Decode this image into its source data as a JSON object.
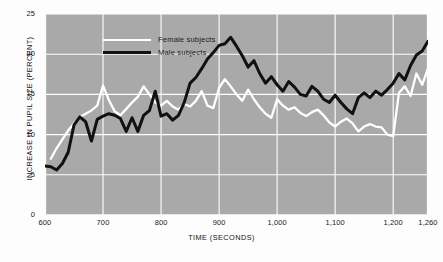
{
  "chart_data": {
    "type": "line",
    "title": "",
    "xlabel": "TIME (SECONDS)",
    "ylabel": "INCREASE IN PUPIL SIZE  (PERCENT)",
    "xlim": [
      600,
      1260
    ],
    "ylim": [
      0,
      25
    ],
    "xticks": [
      600,
      700,
      800,
      900,
      1000,
      1100,
      1200,
      1260
    ],
    "xticklabels": [
      "600",
      "700",
      "800",
      "900",
      "1,000",
      "1,100",
      "1,200",
      "1,260"
    ],
    "yticks": [
      0,
      5,
      10,
      15,
      20,
      25
    ],
    "yticklabels": [
      "0",
      "5",
      "10",
      "15",
      "20",
      "25"
    ],
    "grid": true,
    "grid_color": "#ffffff",
    "plot_background": "#a9a9a9",
    "legend_position": "top-left",
    "annotations": [
      {
        "text": "CONTROL",
        "x": 600,
        "y": 0,
        "color": "#f2f2f2"
      }
    ],
    "series": [
      {
        "name": "Female subjects",
        "color": "#ffffff",
        "x": [
          610,
          620,
          630,
          640,
          650,
          660,
          670,
          680,
          690,
          700,
          710,
          720,
          730,
          740,
          750,
          760,
          770,
          780,
          790,
          800,
          810,
          820,
          830,
          840,
          850,
          860,
          870,
          880,
          890,
          900,
          910,
          920,
          930,
          940,
          950,
          960,
          970,
          980,
          990,
          1000,
          1010,
          1020,
          1030,
          1040,
          1050,
          1060,
          1070,
          1080,
          1090,
          1100,
          1110,
          1120,
          1130,
          1140,
          1150,
          1160,
          1170,
          1180,
          1190,
          1200,
          1210,
          1220,
          1230,
          1240,
          1250,
          1260
        ],
        "y": [
          7.0,
          8.3,
          9.4,
          10.5,
          11.4,
          12.2,
          12.6,
          13.0,
          13.6,
          16.1,
          14.3,
          12.9,
          12.4,
          13.2,
          14.0,
          14.7,
          16.0,
          15.0,
          14.0,
          13.6,
          14.2,
          13.5,
          13.1,
          13.8,
          13.5,
          14.2,
          15.4,
          13.6,
          13.3,
          15.8,
          16.9,
          16.0,
          15.0,
          14.2,
          15.6,
          14.4,
          13.4,
          12.6,
          12.1,
          14.4,
          13.6,
          13.1,
          13.4,
          12.7,
          12.3,
          12.8,
          13.1,
          12.4,
          11.5,
          11.0,
          11.6,
          12.0,
          11.4,
          10.4,
          11.0,
          11.3,
          11.0,
          10.9,
          10.0,
          9.8,
          15.2,
          16.0,
          14.8,
          17.6,
          16.2,
          18.2
        ]
      },
      {
        "name": "Male subjects",
        "color": "#111111",
        "x": [
          600,
          610,
          620,
          630,
          640,
          650,
          660,
          670,
          680,
          690,
          700,
          710,
          720,
          730,
          740,
          750,
          760,
          770,
          780,
          790,
          800,
          810,
          820,
          830,
          840,
          850,
          860,
          870,
          880,
          890,
          900,
          910,
          920,
          930,
          940,
          950,
          960,
          970,
          980,
          990,
          1000,
          1010,
          1020,
          1030,
          1040,
          1050,
          1060,
          1070,
          1080,
          1090,
          1100,
          1110,
          1120,
          1130,
          1140,
          1150,
          1160,
          1170,
          1180,
          1190,
          1200,
          1210,
          1220,
          1230,
          1240,
          1250,
          1260
        ],
        "y": [
          6.1,
          6.0,
          5.6,
          6.4,
          7.8,
          11.2,
          12.2,
          11.6,
          9.2,
          11.9,
          12.3,
          12.6,
          12.4,
          12.0,
          10.4,
          12.1,
          10.4,
          12.4,
          13.0,
          15.4,
          12.3,
          12.6,
          11.8,
          12.4,
          14.0,
          16.4,
          17.1,
          18.2,
          19.4,
          20.2,
          21.1,
          21.3,
          22.1,
          21.0,
          19.8,
          18.4,
          19.2,
          17.6,
          16.4,
          17.2,
          16.2,
          15.4,
          16.6,
          15.9,
          15.0,
          14.8,
          16.0,
          15.4,
          14.4,
          14.0,
          14.9,
          14.0,
          13.2,
          12.6,
          14.6,
          15.2,
          14.6,
          15.4,
          14.9,
          15.6,
          16.4,
          17.6,
          16.8,
          18.6,
          19.9,
          20.4,
          21.6
        ]
      }
    ]
  },
  "legend": {
    "items": [
      {
        "label": "Female subjects",
        "key": "female"
      },
      {
        "label": "Male subjects",
        "key": "male"
      }
    ]
  }
}
